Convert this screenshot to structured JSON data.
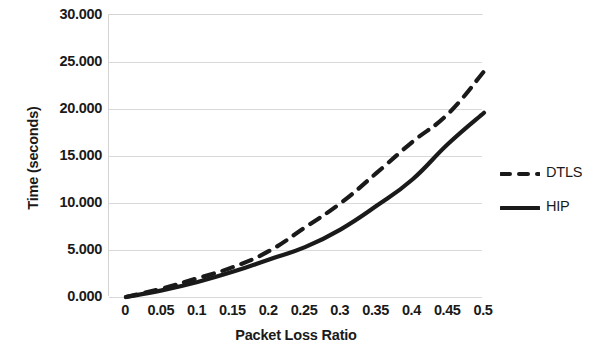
{
  "chart_data": {
    "type": "line",
    "title": "",
    "xlabel": "Packet Loss Ratio",
    "ylabel": "Time (seconds)",
    "x": [
      0,
      0.05,
      0.1,
      0.15,
      0.2,
      0.25,
      0.3,
      0.35,
      0.4,
      0.45,
      0.5
    ],
    "xtick_labels": [
      "0",
      "0.05",
      "0.1",
      "0.15",
      "0.2",
      "0.25",
      "0.3",
      "0.35",
      "0.4",
      "0.45",
      "0.5"
    ],
    "ytick_labels": [
      "30.000",
      "25.000",
      "20.000",
      "15.000",
      "10.000",
      "5.000",
      "0.000"
    ],
    "ytick_values": [
      30,
      25,
      20,
      15,
      10,
      5,
      0
    ],
    "xlim": [
      0,
      0.5
    ],
    "ylim": [
      0,
      30
    ],
    "grid": "horizontal",
    "legend_position": "right",
    "series": [
      {
        "name": "DTLS",
        "style": "dashed",
        "color": "#1a1a1a",
        "values": [
          0.0,
          0.9,
          2.0,
          3.2,
          4.9,
          7.4,
          10.0,
          13.2,
          16.5,
          19.5,
          24.0
        ]
      },
      {
        "name": "HIP",
        "style": "solid",
        "color": "#1a1a1a",
        "values": [
          0.0,
          0.7,
          1.6,
          2.7,
          4.0,
          5.3,
          7.2,
          9.7,
          12.5,
          16.3,
          19.6
        ]
      }
    ]
  },
  "axes": {
    "y_title": "Time (seconds)",
    "x_title": "Packet Loss Ratio"
  },
  "legend": {
    "items": [
      {
        "label": "DTLS",
        "style": "dashed"
      },
      {
        "label": "HIP",
        "style": "solid"
      }
    ]
  }
}
